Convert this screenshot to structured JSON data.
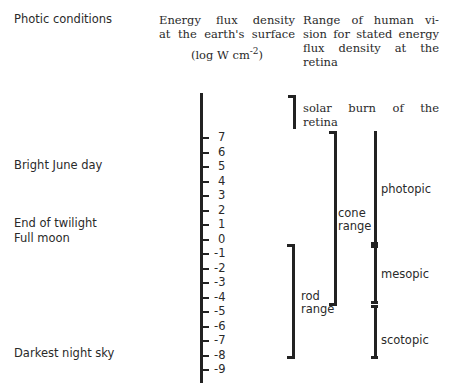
{
  "headers": {
    "col1": "Photic conditions",
    "col2_lines": [
      "Energy flux density",
      "at the earth's surface"
    ],
    "col2_unit_prefix": "(log W cm",
    "col2_unit_sup": "-2",
    "col2_unit_suffix": ")",
    "col3_lines": [
      "Range of human vi-",
      "sion for stated energy",
      "flux density at the",
      "retina"
    ]
  },
  "conditions": [
    {
      "label": "Bright June day",
      "level": 5
    },
    {
      "label": "End of twilight",
      "level": 1
    },
    {
      "label": "Full moon",
      "level": 0
    },
    {
      "label": "Darkest night sky",
      "level": -8
    }
  ],
  "axis": {
    "ticks": [
      "7",
      "6",
      "5",
      "4",
      "3",
      "2",
      "1",
      "0",
      "-1",
      "-2",
      "-3",
      "-4",
      "-5",
      "-6",
      "-7",
      "-8",
      "-9"
    ]
  },
  "ranges": {
    "solar_burn": {
      "line1": "solar burn of the",
      "line2": "retina"
    },
    "cone": {
      "line1": "cone",
      "line2": "range",
      "from": 7,
      "to": -4.8
    },
    "rod": {
      "line1": "rod",
      "line2": "range",
      "from": -0.8,
      "to": -8
    },
    "photopic": {
      "label": "photopic",
      "from": 7,
      "to": 0.3
    },
    "mesopic": {
      "label": "mesopic",
      "from": 0.3,
      "to": -4.6
    },
    "scotopic": {
      "label": "scotopic",
      "from": -4.6,
      "to": -8
    }
  },
  "chart_data": {
    "type": "table",
    "axis_label": "Energy flux density at the earth's surface (log W cm^-2)",
    "axis_range": [
      -9,
      7
    ],
    "conditions": [
      {
        "name": "Bright June day",
        "log_flux": 5
      },
      {
        "name": "End of twilight",
        "log_flux": 1
      },
      {
        "name": "Full moon",
        "log_flux": 0
      },
      {
        "name": "Darkest night sky",
        "log_flux": -8
      }
    ],
    "vision_ranges": [
      {
        "name": "solar burn of the retina",
        "from": 7,
        "to": 9
      },
      {
        "name": "cone range",
        "from": -4.8,
        "to": 7
      },
      {
        "name": "rod range",
        "from": -8,
        "to": -0.8
      },
      {
        "name": "photopic",
        "from": 0.3,
        "to": 7
      },
      {
        "name": "mesopic",
        "from": -4.6,
        "to": 0.3
      },
      {
        "name": "scotopic",
        "from": -8,
        "to": -4.6
      }
    ]
  }
}
